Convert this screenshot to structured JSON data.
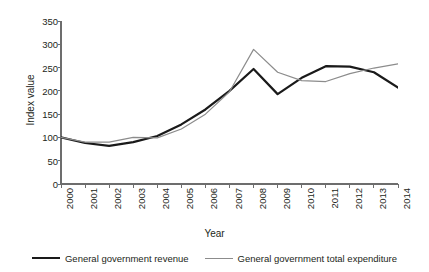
{
  "chart_data": {
    "type": "line",
    "title": "",
    "xlabel": "Year",
    "ylabel": "Index value",
    "x": [
      2000,
      2001,
      2002,
      2003,
      2004,
      2005,
      2006,
      2007,
      2008,
      2009,
      2010,
      2011,
      2012,
      2013,
      2014
    ],
    "categories": [
      "2000",
      "2001",
      "2002",
      "2003",
      "2004",
      "2005",
      "2006",
      "2007",
      "2008",
      "2009",
      "2010",
      "2011",
      "2012",
      "2013",
      "2014"
    ],
    "xlim": [
      2000,
      2014
    ],
    "ylim": [
      0,
      350
    ],
    "yticks": [
      0,
      50,
      100,
      150,
      200,
      250,
      300,
      350
    ],
    "yticklabels": [
      "0",
      "50",
      "100",
      "150",
      "200",
      "250",
      "300",
      "350"
    ],
    "grid": false,
    "legend_position": "bottom",
    "series": [
      {
        "name": "General government revenue",
        "color": "#1a1a1a",
        "linewidth": 2.2,
        "values": [
          100,
          88,
          82,
          90,
          103,
          128,
          160,
          200,
          247,
          193,
          228,
          253,
          252,
          240,
          207
        ]
      },
      {
        "name": "General government total expenditure",
        "color": "#8c8c8c",
        "linewidth": 1.2,
        "values": [
          100,
          90,
          90,
          100,
          99,
          118,
          150,
          198,
          289,
          240,
          222,
          220,
          237,
          249,
          258
        ]
      }
    ]
  },
  "axes": {
    "y_title": "Index value",
    "x_title": "Year"
  },
  "legend": {
    "entries": [
      {
        "label": "General government revenue",
        "style": "thick"
      },
      {
        "label": "General government total expenditure",
        "style": "thin"
      }
    ]
  }
}
